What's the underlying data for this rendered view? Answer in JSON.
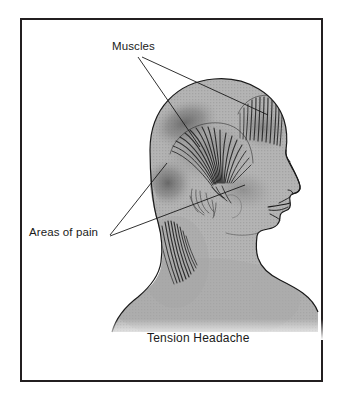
{
  "figure": {
    "caption": "Tension Headache",
    "border_color": "#231f20",
    "background_color": "#ffffff"
  },
  "labels": {
    "muscles": "Muscles",
    "areas_of_pain": "Areas of pain"
  },
  "illustration": {
    "subject": "head-profile-left-facing-right",
    "skin_color": "#b2b2b2",
    "skin_shadow_color": "#9a9a9a",
    "pain_shading_color": "#6e6e6e",
    "muscle_fiber_color": "#2b2b2b",
    "outline_color": "#1a1a1a",
    "leader_line_color": "#1a1a1a",
    "anatomy_parts": [
      "frontalis-muscle",
      "temporalis-muscle-fan",
      "posterior-neck-muscles",
      "facial-profile-nose",
      "facial-profile-lips",
      "facial-profile-chin",
      "ear-region",
      "shoulder"
    ],
    "pain_regions": [
      "posterior-superior-scalp",
      "occipital-region",
      "frontal-temporal-region"
    ]
  }
}
